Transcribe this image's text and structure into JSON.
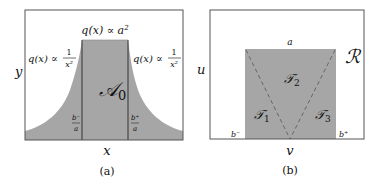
{
  "panel_a": {
    "caption": "(a)",
    "y_axis_label": "y",
    "x_axis_label": "x",
    "center_region_label": "𝒜",
    "center_region_subscript": "0",
    "top_label_q": "q(x) ∝ a",
    "top_label_exp": "2",
    "left_label_q": "q(x) ∝",
    "left_frac_num": "1",
    "left_frac_den": "x²",
    "right_label_q": "q(x) ∝",
    "right_frac_num": "1",
    "right_frac_den": "x²",
    "left_tick_num": "b⁻",
    "left_tick_den": "a",
    "right_tick_num": "b⁺",
    "right_tick_den": "a"
  },
  "panel_b": {
    "caption": "(b)",
    "y_axis_label": "u",
    "x_axis_label": "v",
    "region_label": "ℛ",
    "top_edge_label": "a",
    "triangle_1": "𝒯",
    "triangle_1_sub": "1",
    "triangle_2": "𝒯",
    "triangle_2_sub": "2",
    "triangle_3": "𝒯",
    "triangle_3_sub": "3",
    "left_corner_label": "b⁻",
    "right_corner_label": "b⁺"
  },
  "colors": {
    "fill_gray": "#a6a6a6",
    "line": "#333333",
    "frame": "#555555"
  }
}
